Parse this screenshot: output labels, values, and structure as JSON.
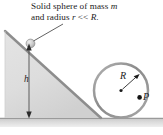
{
  "figure": {
    "name": "inclined-plane-rolling-sphere-diagram",
    "caption": {
      "line1_a": "Solid sphere of mass ",
      "line1_b": "m",
      "line2_a": "and radius ",
      "line2_b": "r",
      "line2_c": " << ",
      "line2_d": "R",
      "line2_e": "."
    },
    "labels": {
      "height": "h",
      "loop_radius": "R",
      "point": "P"
    },
    "colors": {
      "incline_fill": "#dcdcdc",
      "incline_edge": "#8f8f8f",
      "ground_fill": "#d2d2d2",
      "loop_stroke": "#8a8a8a",
      "sphere_fill": "#c8c8c8",
      "text": "#1c1c1c",
      "arrow": "#333333",
      "background": "#ffffff"
    },
    "geometry": {
      "incline_apex": [
        5,
        31
      ],
      "incline_base_left": [
        5,
        118
      ],
      "incline_base_right": [
        101,
        118
      ],
      "ground_y": 118,
      "loop_center": [
        121,
        90
      ],
      "loop_radius_px": 27,
      "point_P_position": [
        138,
        98
      ],
      "sphere_on_incline": [
        30,
        44
      ],
      "height_arrow_top": [
        29,
        45
      ],
      "height_arrow_bottom": [
        29,
        117
      ]
    }
  }
}
